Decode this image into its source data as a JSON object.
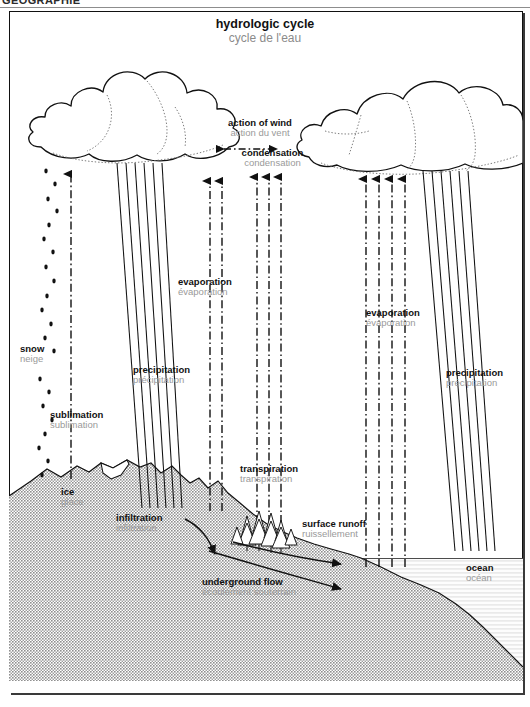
{
  "header": {
    "section_label": "GEOGRAPHIE"
  },
  "title": {
    "en": "hydrologic cycle",
    "fr": "cycle de l'eau"
  },
  "colors": {
    "ink": "#111111",
    "french_label": "#9a9a9a",
    "ground_fill": "#b4b4b4",
    "ocean_fill": "#fbfbfb",
    "seabed_fill": "#b4b4b4",
    "frame": "#111111",
    "page_background": "#ffffff"
  },
  "labels": {
    "action_of_wind": {
      "en": "action of wind",
      "fr": "action du vent"
    },
    "condensation": {
      "en": "condensation",
      "fr": "condensation"
    },
    "snow": {
      "en": "snow",
      "fr": "neige"
    },
    "sublimation": {
      "en": "sublimation",
      "fr": "sublimation"
    },
    "evaporation_left": {
      "en": "evaporation",
      "fr": "évaporation"
    },
    "evaporation_right": {
      "en": "evaporation",
      "fr": "évaporation"
    },
    "precipitation_left": {
      "en": "precipitation",
      "fr": "précipitation"
    },
    "precipitation_right": {
      "en": "precipitation",
      "fr": "précipitation"
    },
    "transpiration": {
      "en": "transpiration",
      "fr": "transpiration"
    },
    "ice": {
      "en": "ice",
      "fr": "glace"
    },
    "infiltration": {
      "en": "infiltration",
      "fr": "infiltration"
    },
    "surface_runoff": {
      "en": "surface runoff",
      "fr": "ruissellement"
    },
    "underground_flow": {
      "en": "underground flow",
      "fr": "écoulement souterrain"
    },
    "ocean": {
      "en": "ocean",
      "fr": "océan"
    }
  },
  "diagram": {
    "type": "process-diagram",
    "elements": [
      "cumulus-cloud-left",
      "cumulus-cloud-right",
      "wind-arrow-bidirectional",
      "snow-fall-dots",
      "rain-streaks-left",
      "rain-streaks-right",
      "evaporation-arrows-left",
      "evaporation-arrows-right",
      "transpiration-arrows",
      "mountain-terrain",
      "ice-patch",
      "conifer-trees",
      "infiltration-arrow",
      "underground-flow-arrow",
      "surface-runoff-arrow",
      "ocean-water",
      "seabed"
    ],
    "arrow_counts": {
      "evaporation_left": 2,
      "evaporation_right": 4,
      "transpiration": 3,
      "sublimation": 1,
      "rain_streaks_left": 6,
      "rain_streaks_right": 6
    }
  }
}
